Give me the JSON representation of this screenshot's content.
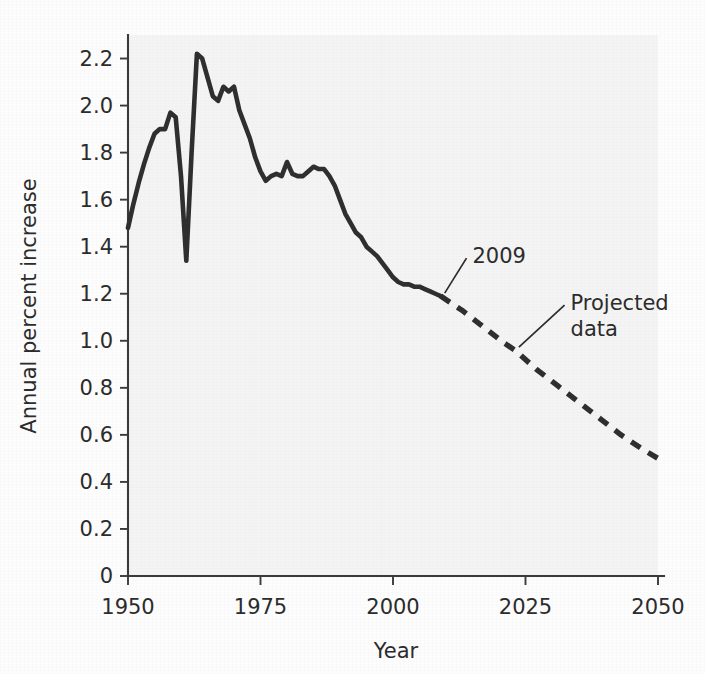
{
  "chart_data": {
    "type": "line",
    "title": "",
    "subtitle": "",
    "xlabel": "Year",
    "ylabel": "Annual percent increase",
    "xlim": [
      1950,
      2050
    ],
    "ylim": [
      0,
      2.3
    ],
    "xticks": [
      "1950",
      "1975",
      "2000",
      "2025",
      "2050"
    ],
    "xtick_values": [
      1950,
      1975,
      2000,
      2025,
      2050
    ],
    "yticks": [
      "0",
      "0.2",
      "0.4",
      "0.6",
      "0.8",
      "1.0",
      "1.2",
      "1.4",
      "1.6",
      "1.8",
      "2.0",
      "2.2"
    ],
    "ytick_values": [
      0,
      0.2,
      0.4,
      0.6,
      0.8,
      1.0,
      1.2,
      1.4,
      1.6,
      1.8,
      2.0,
      2.2
    ],
    "grid": false,
    "legend_position": "none",
    "series": [
      {
        "name": "Historical data",
        "style": "solid",
        "color": "#2e2e2e",
        "x": [
          1950,
          1951,
          1952,
          1953,
          1954,
          1955,
          1956,
          1957,
          1958,
          1959,
          1960,
          1961,
          1962,
          1963,
          1964,
          1965,
          1966,
          1967,
          1968,
          1969,
          1970,
          1971,
          1972,
          1973,
          1974,
          1975,
          1976,
          1977,
          1978,
          1979,
          1980,
          1981,
          1982,
          1983,
          1984,
          1985,
          1986,
          1987,
          1988,
          1989,
          1990,
          1991,
          1992,
          1993,
          1994,
          1995,
          1996,
          1997,
          1998,
          1999,
          2000,
          2001,
          2002,
          2003,
          2004,
          2005,
          2006,
          2007,
          2008,
          2009
        ],
        "y": [
          1.48,
          1.58,
          1.67,
          1.75,
          1.82,
          1.88,
          1.9,
          1.9,
          1.97,
          1.95,
          1.7,
          1.34,
          1.8,
          2.22,
          2.2,
          2.12,
          2.04,
          2.02,
          2.08,
          2.06,
          2.08,
          1.98,
          1.92,
          1.86,
          1.78,
          1.72,
          1.68,
          1.7,
          1.71,
          1.7,
          1.76,
          1.71,
          1.7,
          1.7,
          1.72,
          1.74,
          1.73,
          1.73,
          1.7,
          1.66,
          1.6,
          1.54,
          1.5,
          1.46,
          1.44,
          1.4,
          1.38,
          1.36,
          1.33,
          1.3,
          1.27,
          1.25,
          1.24,
          1.24,
          1.23,
          1.23,
          1.22,
          1.21,
          1.2,
          1.19
        ]
      },
      {
        "name": "Projected data",
        "style": "dashed",
        "color": "#2e2e2e",
        "x": [
          2009,
          2013,
          2017,
          2021,
          2023,
          2027,
          2031,
          2035,
          2039,
          2043,
          2047,
          2050
        ],
        "y": [
          1.19,
          1.13,
          1.06,
          0.99,
          0.96,
          0.88,
          0.81,
          0.74,
          0.67,
          0.6,
          0.54,
          0.5
        ]
      }
    ],
    "annotations": [
      {
        "id": "year-2009",
        "text": "2009",
        "text_x": 2015.0,
        "text_y": 1.33,
        "point_x": 2009,
        "point_y": 1.19
      },
      {
        "id": "projected-data",
        "text": "Projected data",
        "lines": [
          "Projected",
          "data"
        ],
        "text_x": 2033.5,
        "text_y": 1.13,
        "point_x": 2023,
        "point_y": 0.96
      }
    ]
  }
}
